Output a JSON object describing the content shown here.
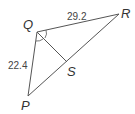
{
  "diagram": {
    "type": "triangle-with-angle-bisector",
    "vertices": {
      "Q": {
        "label": "Q",
        "x": 37,
        "y": 32
      },
      "R": {
        "label": "R",
        "x": 119,
        "y": 14
      },
      "P": {
        "label": "P",
        "x": 28,
        "y": 96
      },
      "S": {
        "label": "S",
        "x": 67,
        "y": 62
      }
    },
    "segments": [
      {
        "from": "Q",
        "to": "R",
        "length_label": "29.2"
      },
      {
        "from": "Q",
        "to": "P",
        "length_label": "22.4"
      },
      {
        "from": "P",
        "to": "R",
        "length_label": ""
      },
      {
        "from": "Q",
        "to": "S",
        "length_label": ""
      }
    ],
    "labels": {
      "QR": "29.2",
      "QP": "22.4",
      "Q": "Q",
      "R": "R",
      "P": "P",
      "S": "S"
    },
    "angle_marks": "Congruent angle arcs at Q: angle PQS and angle SQR (QS bisects angle PQR)",
    "colors": {
      "line": "#555555",
      "text": "#333333",
      "background": "#ffffff"
    }
  }
}
